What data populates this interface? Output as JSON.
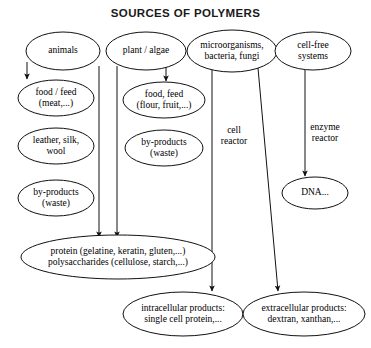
{
  "title": "SOURCES OF POLYMERS",
  "diagram": {
    "type": "flow-diagram",
    "nodes": [
      {
        "id": "animals",
        "label": "animals",
        "cx": 63,
        "cy": 51,
        "rx": 37,
        "ry": 19,
        "font": 9.5
      },
      {
        "id": "plant-algae",
        "label": "plant / algae",
        "cx": 146,
        "cy": 51,
        "rx": 40,
        "ry": 19,
        "font": 9.5
      },
      {
        "id": "microorganisms",
        "label": "microorganisms,\nbacteria, fungi",
        "cx": 232,
        "cy": 51,
        "rx": 45,
        "ry": 21,
        "font": 9.5
      },
      {
        "id": "cell-free",
        "label": "cell-free\nsystems",
        "cx": 313,
        "cy": 51,
        "rx": 38,
        "ry": 19,
        "font": 9.5
      },
      {
        "id": "food-feed-meat",
        "label": "food / feed\n(meat,...)",
        "cx": 56,
        "cy": 98,
        "rx": 38,
        "ry": 18,
        "font": 9.5
      },
      {
        "id": "leather-silk",
        "label": "leather, silk,\nwool",
        "cx": 56,
        "cy": 146,
        "rx": 38,
        "ry": 18,
        "font": 9.5
      },
      {
        "id": "by-products-1",
        "label": "by-products\n(waste)",
        "cx": 56,
        "cy": 198,
        "rx": 38,
        "ry": 18,
        "font": 9.5
      },
      {
        "id": "food-feed-flour",
        "label": "food, feed\n(flour, fruit,...)",
        "cx": 164,
        "cy": 100,
        "rx": 41,
        "ry": 18,
        "font": 9.5
      },
      {
        "id": "by-products-2",
        "label": "by-products\n(waste)",
        "cx": 164,
        "cy": 148,
        "rx": 39,
        "ry": 18,
        "font": 9.5
      },
      {
        "id": "dna",
        "label": "DNA...",
        "cx": 315,
        "cy": 193,
        "rx": 33,
        "ry": 16,
        "font": 9.5
      },
      {
        "id": "protein-poly",
        "label": "protein (gelatine, keratin, gluten,...)\npolysaccharides (cellulose, starch,...)",
        "cx": 118,
        "cy": 257,
        "rx": 97,
        "ry": 22,
        "font": 9.5
      },
      {
        "id": "intracellular",
        "label": "intracellular products:\nsingle cell protein,...",
        "cx": 183,
        "cy": 314,
        "rx": 60,
        "ry": 22,
        "font": 9.5
      },
      {
        "id": "extracellular",
        "label": "extracellular products:\ndextran, xanthan,...",
        "cx": 304,
        "cy": 314,
        "rx": 61,
        "ry": 22,
        "font": 9.5
      }
    ],
    "edges": [
      {
        "id": "animals-to-food",
        "from": "animals",
        "to": "food-feed-meat",
        "points": "27,62 27,79",
        "arrow": true
      },
      {
        "id": "animals-to-protein",
        "from": "animals",
        "to": "protein-poly",
        "points": "99,66 99,237",
        "arrow": true
      },
      {
        "id": "plant-to-food",
        "from": "plant-algae",
        "to": "food-feed-flour",
        "points": "166,66 166,81",
        "arrow": true
      },
      {
        "id": "plant-to-protein",
        "from": "plant-algae",
        "to": "protein-poly",
        "points": "117,66 117,237",
        "arrow": true
      },
      {
        "id": "micro-to-intracellular",
        "from": "microorganisms",
        "to": "intracellular",
        "points": "212,70 212,291",
        "arrow": true
      },
      {
        "id": "micro-to-extracellular",
        "from": "microorganisms",
        "to": "extracellular",
        "points": "258,68 278,291",
        "arrow": true
      },
      {
        "id": "cellfree-to-dna",
        "from": "cell-free",
        "to": "dna",
        "points": "305,70 305,176",
        "arrow": true
      }
    ],
    "edge_labels": [
      {
        "id": "cell-reactor-label",
        "text": "cell\nreactor",
        "x": 234,
        "y": 125,
        "font": 9.5
      },
      {
        "id": "enzyme-reactor-label",
        "text": "enzyme\nreactor",
        "x": 325,
        "y": 122,
        "font": 9.5
      }
    ]
  }
}
